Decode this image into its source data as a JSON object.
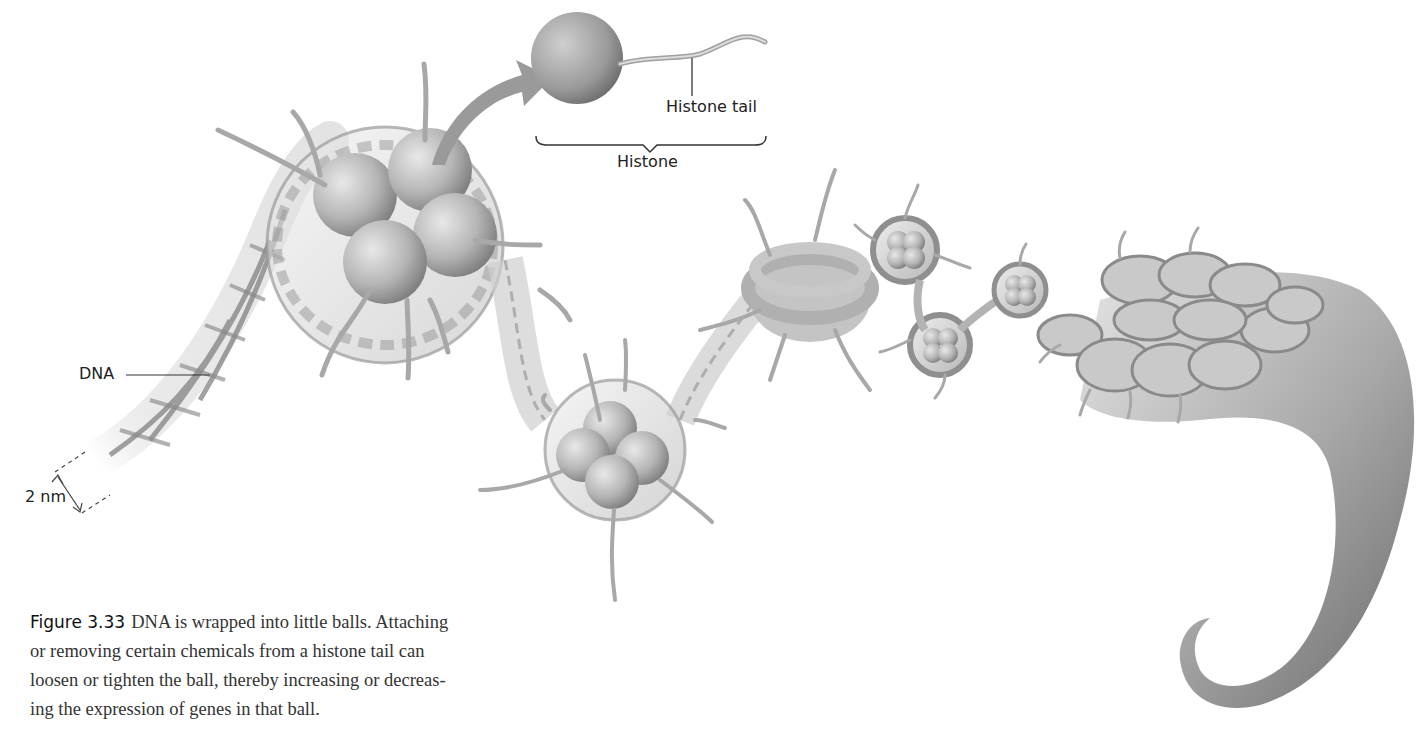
{
  "figure": {
    "number_label": "Figure 3.33",
    "caption_lines": [
      "DNA is wrapped into little balls. Attaching",
      "or removing certain chemicals from a histone tail can",
      "loosen or tighten the ball, thereby increasing or decreas-",
      "ing the expression of genes in that ball."
    ]
  },
  "labels": {
    "dna": "DNA",
    "scale": "2 nm",
    "histone_tail": "Histone tail",
    "histone": "Histone"
  },
  "colors": {
    "background": "#ffffff",
    "ink": "#222222",
    "histone_light": "#d6d6d6",
    "histone_dark": "#8a8a8a",
    "dna_strand": "#7a7a7a",
    "sheath": "#cfcfcf"
  },
  "stages": [
    {
      "name": "dna-double-helix",
      "description": "naked DNA double helix"
    },
    {
      "name": "nucleosome-large",
      "description": "DNA wrapped around histone octamer"
    },
    {
      "name": "nucleosome-lower",
      "description": "second nucleosome"
    },
    {
      "name": "nucleosome-chain",
      "description": "beads-on-a-string"
    },
    {
      "name": "chromatin-fiber",
      "description": "coiled chromatin fiber"
    },
    {
      "name": "condensed-chromosome",
      "description": "tightly packed tapering fiber"
    }
  ]
}
